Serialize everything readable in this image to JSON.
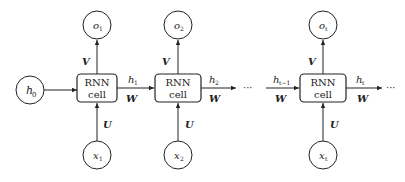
{
  "diagram": {
    "h0_label": "h",
    "h0_sub": "0",
    "cells": [
      {
        "line1": "RNN",
        "line2": "cell",
        "out_label": "o",
        "out_sub": "1",
        "in_label": "x",
        "in_sub": "1",
        "hidden_label": "h",
        "hidden_sub": "1",
        "v": "V",
        "u": "U",
        "w": "W"
      },
      {
        "line1": "RNN",
        "line2": "cell",
        "out_label": "o",
        "out_sub": "2",
        "in_label": "x",
        "in_sub": "2",
        "hidden_label": "h",
        "hidden_sub": "2",
        "v": "V",
        "u": "U",
        "w": "W"
      },
      {
        "line1": "RNN",
        "line2": "cell",
        "out_label": "o",
        "out_sub": "t",
        "in_label": "x",
        "in_sub": "t",
        "hidden_label": "h",
        "hidden_sub": "t",
        "v": "V",
        "u": "U",
        "w": "W"
      }
    ],
    "prev_hidden_label": "h",
    "prev_hidden_sub": "t−1",
    "prev_w": "W",
    "ellipsis": "···"
  }
}
